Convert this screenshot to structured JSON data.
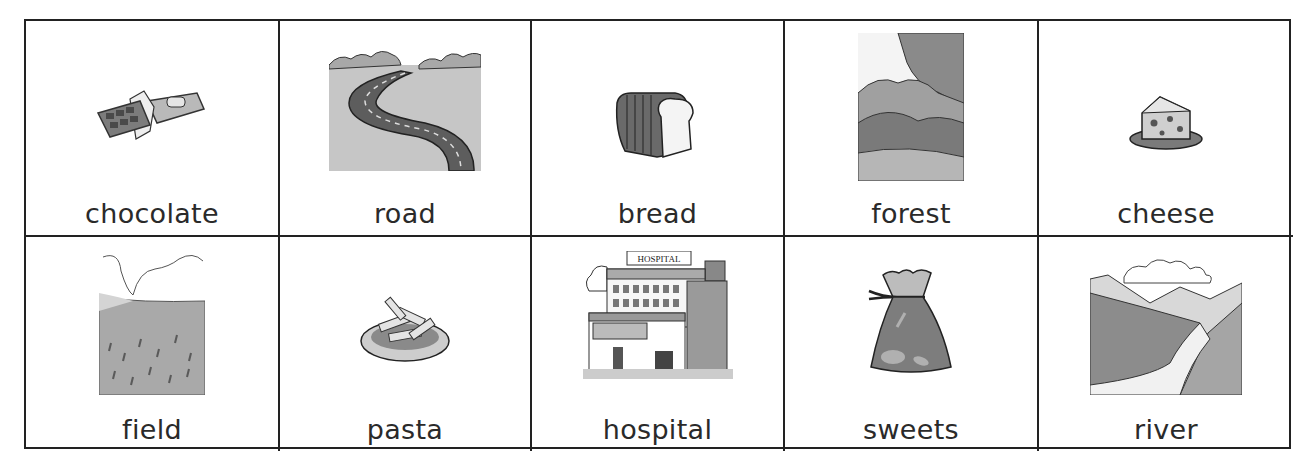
{
  "worksheet": {
    "cards": [
      {
        "word": "chocolate",
        "icon": "chocolate-bar-icon"
      },
      {
        "word": "road",
        "icon": "winding-road-icon"
      },
      {
        "word": "bread",
        "icon": "bread-loaf-icon"
      },
      {
        "word": "forest",
        "icon": "forest-icon"
      },
      {
        "word": "cheese",
        "icon": "cheese-icon"
      },
      {
        "word": "field",
        "icon": "field-icon"
      },
      {
        "word": "pasta",
        "icon": "pasta-plate-icon"
      },
      {
        "word": "hospital",
        "icon": "hospital-building-icon",
        "sign": "HOSPITAL"
      },
      {
        "word": "sweets",
        "icon": "sweets-bag-icon"
      },
      {
        "word": "river",
        "icon": "river-valley-icon"
      }
    ]
  }
}
